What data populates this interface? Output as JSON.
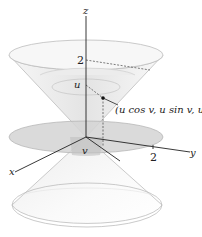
{
  "figure": {
    "axes": {
      "x_label": "x",
      "y_label": "y",
      "z_label": "z"
    },
    "tick_labels": {
      "z_tick": "2",
      "y_tick": "2"
    },
    "parameters": {
      "height_label": "u",
      "angle_label": "v"
    },
    "point_label": "(u cos v, u sin v, u)",
    "colors": {
      "cone_fill": "#f2f2f2",
      "cone_edge": "#b8b8b8",
      "disk_fill": "#d0d0d0",
      "axis": "#222222",
      "dashed": "#444444"
    }
  }
}
